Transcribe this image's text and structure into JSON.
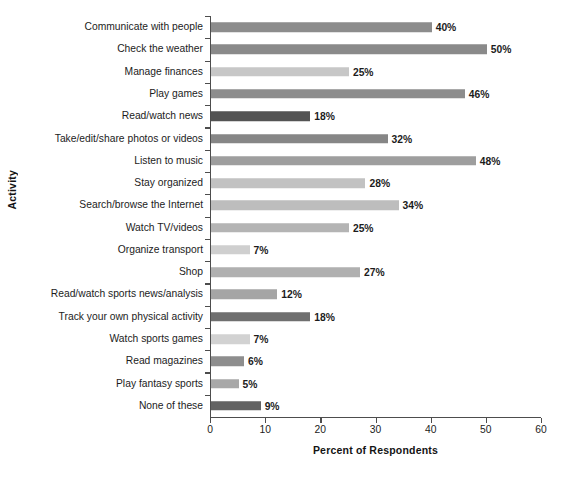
{
  "chart_data": {
    "type": "bar",
    "orientation": "horizontal",
    "title": "",
    "xlabel": "Percent of Respondents",
    "ylabel": "Activity",
    "xlim": [
      0,
      60
    ],
    "xticks": [
      0,
      10,
      20,
      30,
      40,
      50,
      60
    ],
    "xtick_labels": [
      "0",
      "10",
      "20",
      "30",
      "40",
      "50",
      "60"
    ],
    "grid": false,
    "legend": null,
    "value_label_suffix": "%",
    "categories": [
      "Communicate with people",
      "Check the weather",
      "Manage finances",
      "Play games",
      "Read/watch news",
      "Take/edit/share photos or videos",
      "Listen to music",
      "Stay organized",
      "Search/browse the Internet",
      "Watch TV/videos",
      "Organize transport",
      "Shop",
      "Read/watch sports news/analysis",
      "Track your own physical activity",
      "Watch sports games",
      "Read magazines",
      "Play fantasy sports",
      "None of these"
    ],
    "values": [
      40,
      50,
      25,
      46,
      18,
      32,
      48,
      28,
      34,
      25,
      7,
      27,
      12,
      18,
      7,
      6,
      5,
      9
    ],
    "value_labels": [
      "40%",
      "50%",
      "25%",
      "46%",
      "18%",
      "32%",
      "48%",
      "28%",
      "34%",
      "25%",
      "7%",
      "27%",
      "12%",
      "18%",
      "7%",
      "6%",
      "5%",
      "9%"
    ],
    "bar_colors": [
      "#8c8c8c",
      "#8a8a8a",
      "#c7c7c7",
      "#8d8d8d",
      "#535353",
      "#868686",
      "#9e9e9e",
      "#c2c2c2",
      "#bdbdbd",
      "#b4b4b4",
      "#cfcfcf",
      "#b0b0b0",
      "#a5a5a5",
      "#6f6f6f",
      "#d2d2d2",
      "#8e8e8e",
      "#a8a8a8",
      "#636363"
    ],
    "axis_color": "#4d4d4d"
  }
}
